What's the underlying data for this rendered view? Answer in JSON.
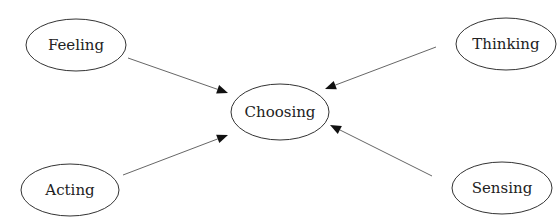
{
  "diagram": {
    "type": "concept-map",
    "colors": {
      "background": "#ffffff",
      "node_stroke": "#333333",
      "edge_stroke": "#555555",
      "text": "#222222"
    },
    "nodes": [
      {
        "id": "feeling",
        "label": "Feeling",
        "cx": 76,
        "cy": 45,
        "rx": 50,
        "ry": 26
      },
      {
        "id": "thinking",
        "label": "Thinking",
        "cx": 506,
        "cy": 44,
        "rx": 50,
        "ry": 26
      },
      {
        "id": "choosing",
        "label": "Choosing",
        "cx": 280,
        "cy": 112,
        "rx": 49,
        "ry": 28
      },
      {
        "id": "acting",
        "label": "Acting",
        "cx": 70,
        "cy": 190,
        "rx": 49,
        "ry": 26
      },
      {
        "id": "sensing",
        "label": "Sensing",
        "cx": 502,
        "cy": 188,
        "rx": 50,
        "ry": 26
      }
    ],
    "edges": [
      {
        "from": "feeling",
        "to": "choosing",
        "x1": 128,
        "y1": 58,
        "x2": 228,
        "y2": 93
      },
      {
        "from": "thinking",
        "to": "choosing",
        "x1": 436,
        "y1": 47,
        "x2": 325,
        "y2": 89
      },
      {
        "from": "acting",
        "to": "choosing",
        "x1": 123,
        "y1": 175,
        "x2": 228,
        "y2": 135
      },
      {
        "from": "sensing",
        "to": "choosing",
        "x1": 432,
        "y1": 176,
        "x2": 330,
        "y2": 125
      }
    ]
  }
}
